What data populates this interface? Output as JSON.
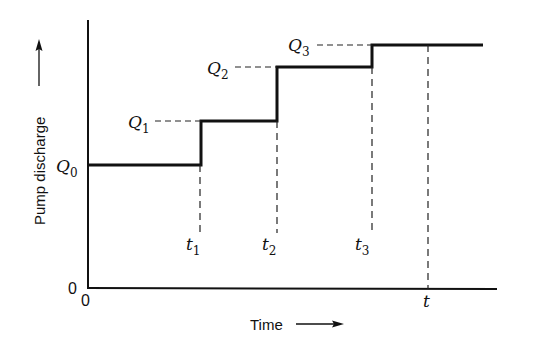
{
  "diagram": {
    "y_axis_label": "Pump discharge",
    "x_axis_label": "Time",
    "origin_x_label": "0",
    "origin_y_label": "0",
    "levels": [
      {
        "symbol": "Q",
        "sub": "0"
      },
      {
        "symbol": "Q",
        "sub": "1"
      },
      {
        "symbol": "Q",
        "sub": "2"
      },
      {
        "symbol": "Q",
        "sub": "3"
      }
    ],
    "times": [
      {
        "symbol": "t",
        "sub": "1"
      },
      {
        "symbol": "t",
        "sub": "2"
      },
      {
        "symbol": "t",
        "sub": "3"
      },
      {
        "symbol": "t",
        "sub": ""
      }
    ],
    "colors": {
      "line": "#111111",
      "background": "#ffffff"
    }
  }
}
